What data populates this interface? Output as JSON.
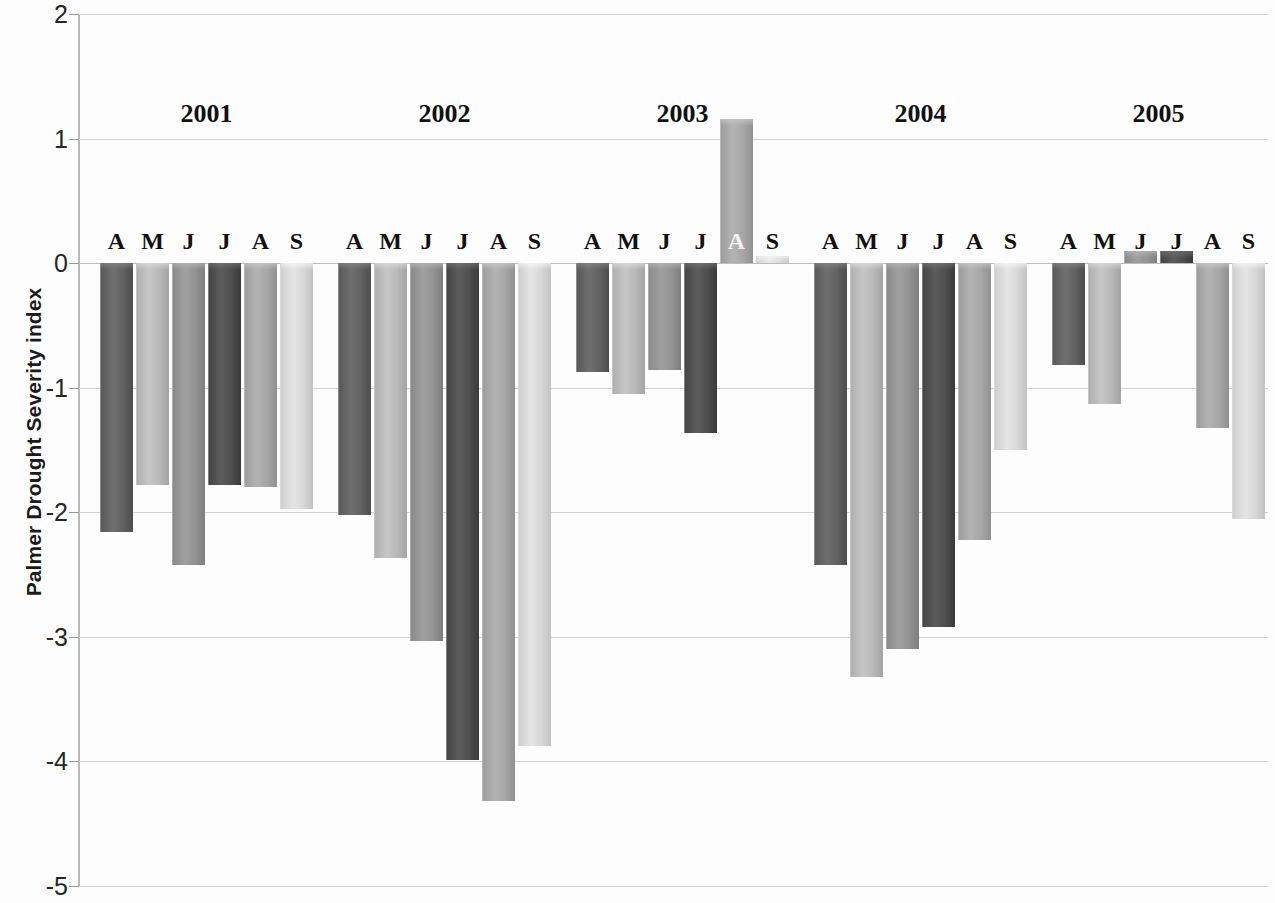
{
  "chart_data": {
    "type": "bar",
    "title": "",
    "xlabel": "",
    "ylabel": "Palmer Drought Severity index",
    "ylim": [
      -5,
      2
    ],
    "ytick_labels": [
      "2",
      "1",
      "0",
      "-1",
      "-2",
      "-3",
      "-4",
      "-5"
    ],
    "ytick_values": [
      2,
      1,
      0,
      -1,
      -2,
      -3,
      -4,
      -5
    ],
    "grid": true,
    "legend": "none",
    "group_labels": [
      "2001",
      "2002",
      "2003",
      "2004",
      "2005"
    ],
    "categories": [
      "A",
      "M",
      "J",
      "J",
      "A",
      "S"
    ],
    "series": [
      {
        "name": "2001",
        "values": [
          -2.16,
          -1.78,
          -2.42,
          -1.78,
          -1.8,
          -1.97
        ]
      },
      {
        "name": "2002",
        "values": [
          -2.02,
          -2.37,
          -3.03,
          -3.99,
          -4.32,
          -3.88
        ]
      },
      {
        "name": "2003",
        "values": [
          -0.87,
          -1.05,
          -0.86,
          -1.36,
          1.16,
          0.06
        ]
      },
      {
        "name": "2004",
        "values": [
          -2.42,
          -3.32,
          -3.1,
          -2.92,
          -2.22,
          -1.5
        ]
      },
      {
        "name": "2005",
        "values": [
          -0.82,
          -1.13,
          0.1,
          0.1,
          -1.32,
          -2.05
        ]
      }
    ],
    "series_colors": [
      "#595959",
      "#b0b0b0",
      "#8a8a8a",
      "#464646",
      "#9d9d9d",
      "#cfcfcf"
    ],
    "highlighted_month_label": {
      "group": "2003",
      "index": 4,
      "letter": "A"
    }
  }
}
